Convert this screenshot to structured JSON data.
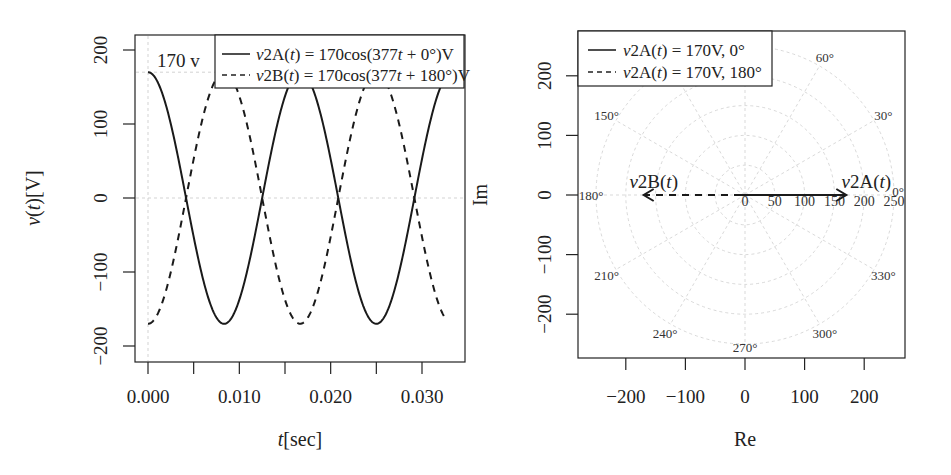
{
  "chart_data": [
    {
      "type": "line",
      "title": "",
      "xlabel": "t[sec]",
      "ylabel": "v(t)[V]",
      "xlim": [
        -0.0014,
        0.0349
      ],
      "ylim": [
        -220,
        220
      ],
      "x_ticks": [
        0.0,
        0.005,
        0.01,
        0.015,
        0.02,
        0.025,
        0.03
      ],
      "x_tick_labels": [
        "0.000",
        "",
        "0.010",
        "",
        "0.020",
        "",
        "0.030"
      ],
      "y_ticks": [
        -200,
        -100,
        0,
        100,
        200
      ],
      "y_tick_labels": [
        "−200",
        "−100",
        "0",
        "100",
        "200"
      ],
      "grid": {
        "h": [
          170,
          0
        ],
        "v": [
          0
        ]
      },
      "annotation": "170 v",
      "t_range": [
        0,
        0.0325
      ],
      "series": [
        {
          "name": "v2A(t) = 170cos(377t + 0°)V",
          "amplitude": 170,
          "omega": 377,
          "phase_deg": 0,
          "style": "solid"
        },
        {
          "name": "v2B(t) = 170cos(377t + 180°)V",
          "amplitude": 170,
          "omega": 377,
          "phase_deg": 180,
          "style": "dashed"
        }
      ],
      "legend_position": "top-right"
    },
    {
      "type": "scatter",
      "subtype": "phasor",
      "title": "",
      "xlabel": "Re",
      "ylabel": "Im",
      "xlim": [
        -270,
        270
      ],
      "ylim": [
        -270,
        270
      ],
      "x_ticks": [
        -200,
        -100,
        0,
        100,
        200
      ],
      "x_tick_labels": [
        "−200",
        "−100",
        "0",
        "100",
        "200"
      ],
      "y_ticks": [
        -200,
        -100,
        0,
        100,
        200
      ],
      "y_tick_labels": [
        "−200",
        "−100",
        "0",
        "100",
        "200"
      ],
      "polar_grid": {
        "radii": [
          50,
          100,
          150,
          200,
          250
        ],
        "radial_labels": [
          "0",
          "50",
          "100",
          "150",
          "200",
          "250"
        ],
        "angles_deg": [
          0,
          30,
          60,
          90,
          120,
          150,
          180,
          210,
          240,
          270,
          300,
          330
        ],
        "angle_labels": [
          "0°",
          "30°",
          "60°",
          "90°",
          "120°",
          "150°",
          "180°",
          "210°",
          "240°",
          "270°",
          "300°",
          "330°"
        ]
      },
      "series": [
        {
          "name": "v2A(t) = 170V, 0°",
          "magnitude": 170,
          "angle_deg": 0,
          "label": "v2A(t)",
          "style": "solid"
        },
        {
          "name": "v2A(t) = 170V, 180°",
          "magnitude": 170,
          "angle_deg": 180,
          "label": "v2B(t)",
          "style": "dashed"
        }
      ],
      "legend_position": "top-left"
    }
  ]
}
